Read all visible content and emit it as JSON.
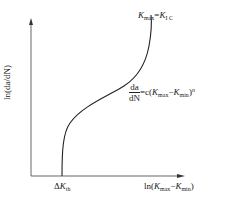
{
  "diagram": {
    "type": "fatigue crack growth curve",
    "y_axis_label": "ln(da/dN)",
    "x_axis_label": {
      "prefix": "ln(",
      "k1": "K",
      "k1_sub": "max",
      "minus": "−",
      "k2": "K",
      "k2_sub": "min",
      "suffix": ")"
    },
    "threshold_label": {
      "delta": "Δ",
      "k": "K",
      "sub": "th"
    },
    "upper_limit_label": {
      "k1": "K",
      "k1_sub": "max",
      "eq": "=",
      "k2": "K",
      "k2_sub": "I C"
    },
    "equation": {
      "numerator": "da",
      "denominator": "dN",
      "rhs_prefix": "=c(",
      "k1": "K",
      "k1_sub": "max",
      "minus": "−",
      "k2": "K",
      "k2_sub": "min",
      "rhs_suffix": ")",
      "exponent": "n"
    },
    "colors": {
      "line": "#222222",
      "axis": "#555555"
    }
  }
}
